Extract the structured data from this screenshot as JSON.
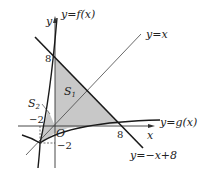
{
  "diagram": {
    "axes": {
      "x_label": "x",
      "y_label": "y",
      "origin_label": "O"
    },
    "curves": {
      "f": "y=f(x)",
      "g": "y=g(x)",
      "identity": "y=x",
      "line": "y=−x+8"
    },
    "ticks": {
      "y8": "8",
      "x8": "8",
      "xneg2": "−2",
      "yneg2": "−2"
    },
    "regions": {
      "s1": "S",
      "s1_sub": "1",
      "s2": "S",
      "s2_sub": "2"
    },
    "colors": {
      "shade": "#c8c8c8",
      "line": "#1a1a1a",
      "thin": "#333333"
    }
  }
}
